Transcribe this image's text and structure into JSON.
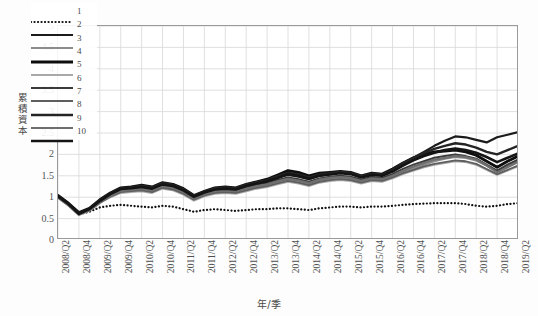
{
  "axes": {
    "ylabel": "累積資本",
    "ylabel_chars": [
      "累",
      "積",
      "資",
      "本"
    ],
    "xlabel": "年/季",
    "yticks": [
      "0",
      "0.5",
      "1",
      "1.5",
      "2",
      "2.5",
      "3",
      "3.5",
      "4",
      "4.5",
      "5"
    ],
    "ylim": [
      0,
      5
    ],
    "grid": true
  },
  "legend": {
    "position": "upper-left-inside",
    "items": [
      {
        "label": "1",
        "style": "dotted",
        "color": "#111111",
        "width": 1.8
      },
      {
        "label": "2",
        "style": "solid",
        "color": "#1b1b1b",
        "width": 2.2
      },
      {
        "label": "3",
        "style": "solid",
        "color": "#8c8c8c",
        "width": 2.2
      },
      {
        "label": "4",
        "style": "solid",
        "color": "#0d0d0d",
        "width": 2.8
      },
      {
        "label": "5",
        "style": "solid",
        "color": "#a9a9a9",
        "width": 2.0
      },
      {
        "label": "6",
        "style": "solid",
        "color": "#3a3a3a",
        "width": 2.0
      },
      {
        "label": "7",
        "style": "solid",
        "color": "#5e5e5e",
        "width": 1.8
      },
      {
        "label": "8",
        "style": "solid",
        "color": "#242424",
        "width": 2.4
      },
      {
        "label": "9",
        "style": "solid",
        "color": "#6e6e6e",
        "width": 2.2
      },
      {
        "label": "10",
        "style": "solid",
        "color": "#141414",
        "width": 2.6
      }
    ]
  },
  "chart_data": {
    "type": "line",
    "title": "",
    "xlabel": "年/季",
    "ylabel": "累積資本",
    "ylim": [
      0,
      5
    ],
    "ytick_step": 0.5,
    "grid": true,
    "legend": [
      "1",
      "2",
      "3",
      "4",
      "5",
      "6",
      "7",
      "8",
      "9",
      "10"
    ],
    "x": [
      "2008/Q2",
      "2008/Q3",
      "2008/Q4",
      "2009/Q1",
      "2009/Q2",
      "2009/Q3",
      "2009/Q4",
      "2010/Q1",
      "2010/Q2",
      "2010/Q3",
      "2010/Q4",
      "2011/Q1",
      "2011/Q2",
      "2011/Q3",
      "2011/Q4",
      "2012/Q1",
      "2012/Q2",
      "2012/Q3",
      "2012/Q4",
      "2013/Q1",
      "2013/Q2",
      "2013/Q3",
      "2013/Q4",
      "2014/Q1",
      "2014/Q2",
      "2014/Q3",
      "2014/Q4",
      "2015/Q1",
      "2015/Q2",
      "2015/Q3",
      "2015/Q4",
      "2016/Q1",
      "2016/Q2",
      "2016/Q3",
      "2016/Q4",
      "2017/Q1",
      "2017/Q2",
      "2017/Q3",
      "2017/Q4",
      "2018/Q1",
      "2018/Q2",
      "2018/Q3",
      "2018/Q4",
      "2019/Q1",
      "2019/Q2"
    ],
    "xtick_labels": [
      "2008/Q2",
      "2008/Q4",
      "2009/Q2",
      "2009/Q4",
      "2010/Q2",
      "2010/Q4",
      "2011/Q2",
      "2011/Q4",
      "2012/Q2",
      "2012/Q4",
      "2013/Q2",
      "2013/Q4",
      "2014/Q2",
      "2014/Q4",
      "2015/Q2",
      "2015/Q4",
      "2016/Q2",
      "2016/Q4",
      "2017/Q2",
      "2017/Q4",
      "2018/Q2",
      "2018/Q4",
      "2019/Q2"
    ],
    "series": [
      {
        "name": "1",
        "values": [
          1.0,
          0.82,
          0.6,
          0.66,
          0.76,
          0.8,
          0.82,
          0.8,
          0.78,
          0.76,
          0.8,
          0.78,
          0.72,
          0.66,
          0.7,
          0.72,
          0.7,
          0.68,
          0.7,
          0.72,
          0.72,
          0.74,
          0.74,
          0.72,
          0.7,
          0.74,
          0.76,
          0.78,
          0.78,
          0.76,
          0.78,
          0.78,
          0.8,
          0.82,
          0.84,
          0.85,
          0.86,
          0.86,
          0.86,
          0.84,
          0.8,
          0.78,
          0.8,
          0.84,
          0.86
        ]
      },
      {
        "name": "2",
        "values": [
          1.02,
          0.84,
          0.62,
          0.72,
          0.92,
          1.08,
          1.2,
          1.22,
          1.26,
          1.22,
          1.32,
          1.28,
          1.18,
          1.02,
          1.12,
          1.2,
          1.22,
          1.2,
          1.28,
          1.34,
          1.38,
          1.46,
          1.52,
          1.48,
          1.42,
          1.5,
          1.54,
          1.58,
          1.56,
          1.48,
          1.54,
          1.52,
          1.62,
          1.78,
          1.92,
          2.06,
          2.2,
          2.32,
          2.42,
          2.4,
          2.34,
          2.28,
          2.4,
          2.46,
          2.52
        ]
      },
      {
        "name": "3",
        "values": [
          1.0,
          0.82,
          0.6,
          0.7,
          0.88,
          1.02,
          1.14,
          1.16,
          1.18,
          1.14,
          1.24,
          1.2,
          1.1,
          0.96,
          1.06,
          1.12,
          1.14,
          1.12,
          1.18,
          1.24,
          1.28,
          1.34,
          1.4,
          1.36,
          1.3,
          1.38,
          1.42,
          1.44,
          1.42,
          1.36,
          1.42,
          1.4,
          1.48,
          1.58,
          1.68,
          1.76,
          1.84,
          1.9,
          1.94,
          1.92,
          1.86,
          1.74,
          1.6,
          1.72,
          1.84
        ]
      },
      {
        "name": "4",
        "values": [
          1.04,
          0.86,
          0.64,
          0.74,
          0.94,
          1.1,
          1.22,
          1.24,
          1.28,
          1.24,
          1.34,
          1.3,
          1.2,
          1.04,
          1.14,
          1.22,
          1.24,
          1.22,
          1.3,
          1.36,
          1.42,
          1.52,
          1.62,
          1.58,
          1.5,
          1.56,
          1.58,
          1.6,
          1.58,
          1.5,
          1.56,
          1.54,
          1.66,
          1.8,
          1.92,
          2.0,
          2.06,
          2.08,
          2.1,
          2.06,
          1.98,
          1.84,
          1.7,
          1.84,
          1.96
        ]
      },
      {
        "name": "5",
        "values": [
          0.98,
          0.8,
          0.58,
          0.68,
          0.86,
          1.0,
          1.1,
          1.12,
          1.14,
          1.1,
          1.2,
          1.16,
          1.06,
          0.92,
          1.02,
          1.08,
          1.1,
          1.08,
          1.14,
          1.2,
          1.24,
          1.3,
          1.36,
          1.32,
          1.26,
          1.34,
          1.38,
          1.4,
          1.38,
          1.32,
          1.38,
          1.36,
          1.44,
          1.54,
          1.62,
          1.7,
          1.76,
          1.8,
          1.84,
          1.82,
          1.76,
          1.64,
          1.52,
          1.62,
          1.72
        ]
      },
      {
        "name": "6",
        "values": [
          1.01,
          0.83,
          0.61,
          0.71,
          0.9,
          1.05,
          1.17,
          1.19,
          1.22,
          1.18,
          1.28,
          1.24,
          1.14,
          0.99,
          1.09,
          1.16,
          1.18,
          1.16,
          1.22,
          1.28,
          1.33,
          1.4,
          1.46,
          1.42,
          1.36,
          1.44,
          1.48,
          1.5,
          1.48,
          1.41,
          1.47,
          1.45,
          1.54,
          1.66,
          1.76,
          1.84,
          1.92,
          1.96,
          2.0,
          1.96,
          1.9,
          1.76,
          1.62,
          1.76,
          1.88
        ]
      },
      {
        "name": "7",
        "values": [
          0.99,
          0.81,
          0.59,
          0.69,
          0.87,
          1.01,
          1.12,
          1.14,
          1.16,
          1.12,
          1.22,
          1.18,
          1.08,
          0.94,
          1.04,
          1.1,
          1.12,
          1.1,
          1.16,
          1.22,
          1.26,
          1.32,
          1.38,
          1.34,
          1.28,
          1.36,
          1.4,
          1.42,
          1.4,
          1.34,
          1.4,
          1.38,
          1.46,
          1.56,
          1.64,
          1.72,
          1.78,
          1.82,
          1.86,
          1.84,
          1.78,
          1.66,
          1.54,
          1.64,
          1.74
        ]
      },
      {
        "name": "8",
        "values": [
          1.03,
          0.85,
          0.63,
          0.73,
          0.93,
          1.09,
          1.21,
          1.23,
          1.27,
          1.23,
          1.33,
          1.29,
          1.19,
          1.03,
          1.13,
          1.21,
          1.23,
          1.21,
          1.29,
          1.35,
          1.4,
          1.49,
          1.57,
          1.53,
          1.46,
          1.53,
          1.56,
          1.59,
          1.57,
          1.49,
          1.55,
          1.53,
          1.64,
          1.79,
          1.92,
          2.03,
          2.13,
          2.2,
          2.26,
          2.23,
          2.16,
          2.06,
          2.0,
          2.1,
          2.2
        ]
      },
      {
        "name": "9",
        "values": [
          1.0,
          0.82,
          0.6,
          0.7,
          0.89,
          1.03,
          1.15,
          1.17,
          1.2,
          1.16,
          1.26,
          1.22,
          1.12,
          0.97,
          1.07,
          1.14,
          1.16,
          1.14,
          1.2,
          1.26,
          1.3,
          1.37,
          1.43,
          1.39,
          1.33,
          1.41,
          1.45,
          1.47,
          1.45,
          1.38,
          1.44,
          1.42,
          1.5,
          1.62,
          1.72,
          1.8,
          1.88,
          1.92,
          1.96,
          1.94,
          1.88,
          1.74,
          1.58,
          1.7,
          1.82
        ]
      },
      {
        "name": "10",
        "values": [
          1.02,
          0.84,
          0.61,
          0.72,
          0.91,
          1.07,
          1.19,
          1.21,
          1.24,
          1.2,
          1.3,
          1.26,
          1.16,
          1.01,
          1.11,
          1.18,
          1.2,
          1.18,
          1.26,
          1.32,
          1.37,
          1.45,
          1.54,
          1.5,
          1.43,
          1.5,
          1.53,
          1.56,
          1.54,
          1.46,
          1.52,
          1.5,
          1.6,
          1.74,
          1.86,
          1.96,
          2.04,
          2.1,
          2.14,
          2.1,
          2.04,
          1.94,
          1.82,
          1.92,
          2.02
        ]
      }
    ]
  }
}
